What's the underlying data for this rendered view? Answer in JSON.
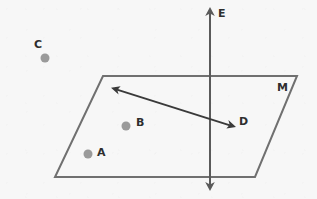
{
  "figure": {
    "type": "geometry-diagram",
    "background_color": "#f7f7f7",
    "width": 317,
    "height": 199
  },
  "plane": {
    "name_label": "M",
    "shape": "parallelogram",
    "stroke_color": "#707070",
    "stroke_width": 2,
    "fill": "none",
    "corners": {
      "top_left": [
        103,
        76
      ],
      "top_right": [
        297,
        76
      ],
      "bottom_right": [
        255,
        177
      ],
      "bottom_left": [
        55,
        177
      ]
    },
    "label_position": [
      277,
      82
    ]
  },
  "vertical_line": {
    "name_label": "E",
    "stroke_color": "#5a5a5a",
    "stroke_width": 2,
    "x": 210,
    "y_top": 8,
    "y_bottom": 190,
    "arrow_top": true,
    "arrow_bottom": true,
    "label_position": [
      218,
      8
    ]
  },
  "diagonal_line": {
    "name_label": "D",
    "stroke_color": "#3a3a3a",
    "stroke_width": 2,
    "from": [
      112,
      88
    ],
    "to": [
      235,
      127
    ],
    "arrow_start": true,
    "arrow_end": true,
    "label_position": [
      239,
      116
    ]
  },
  "points": [
    {
      "label": "A",
      "dot": [
        88,
        154
      ],
      "label_position": [
        97,
        147
      ],
      "radius": 4.5,
      "color": "#9a9a9a",
      "inside_plane": true
    },
    {
      "label": "B",
      "dot": [
        126,
        126
      ],
      "label_position": [
        136,
        117
      ],
      "radius": 4.5,
      "color": "#9a9a9a",
      "inside_plane": true
    },
    {
      "label": "C",
      "dot": [
        45,
        58
      ],
      "label_position": [
        34,
        39
      ],
      "radius": 4.5,
      "color": "#9a9a9a",
      "inside_plane": false
    }
  ]
}
